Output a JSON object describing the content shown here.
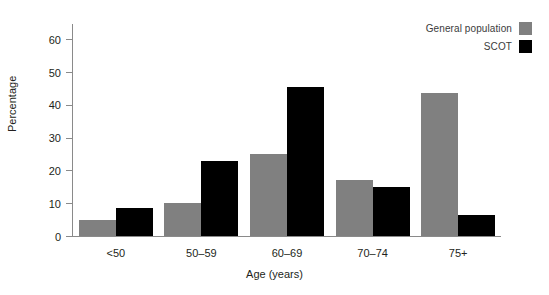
{
  "chart_data": {
    "type": "bar",
    "title": "",
    "xlabel": "Age (years)",
    "ylabel": "Percentage",
    "categories": [
      "<50",
      "50–59",
      "60–69",
      "70–74",
      "75+"
    ],
    "series": [
      {
        "name": "General population",
        "color": "#808080",
        "values": [
          5,
          10,
          25,
          17,
          43.5
        ]
      },
      {
        "name": "SCOT",
        "color": "#000000",
        "values": [
          8.5,
          23,
          45.5,
          15,
          6.5
        ]
      }
    ],
    "ylim": [
      0,
      65
    ],
    "yticks": [
      0,
      10,
      20,
      30,
      40,
      50,
      60
    ],
    "ytick_labels": [
      "0",
      "10",
      "20",
      "30",
      "40",
      "50",
      "60"
    ],
    "grid": false,
    "legend_position": "top-right"
  },
  "legend": {
    "items": [
      {
        "label": "General population",
        "swatch": "#808080"
      },
      {
        "label": "SCOT",
        "swatch": "#000000"
      }
    ]
  },
  "colors": {
    "general_population": "#808080",
    "scot": "#000000",
    "axis": "#8a8a8a",
    "text": "#231f20",
    "background": "#ffffff"
  }
}
